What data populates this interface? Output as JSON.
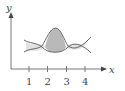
{
  "diagram": {
    "axes": {
      "x_label": "x",
      "y_label": "y",
      "x_ticks": [
        "1",
        "2",
        "3",
        "4"
      ]
    },
    "regions": [
      {
        "name": "left-lobe",
        "fill": "#e2e2e2"
      },
      {
        "name": "center-lobe",
        "fill": "#b9b9b9"
      },
      {
        "name": "right-lobe",
        "fill": "#e2e2e2"
      }
    ],
    "colors": {
      "axis": "#777777",
      "curve": "#666666",
      "text": "#444444"
    }
  }
}
